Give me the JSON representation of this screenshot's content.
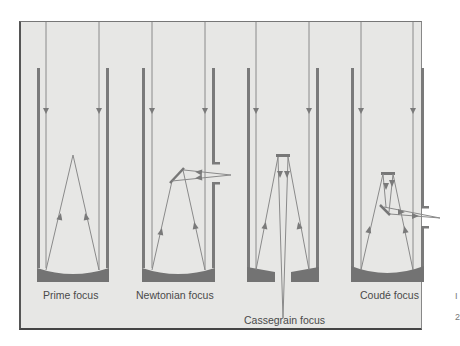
{
  "figure": {
    "panels": [
      {
        "id": "prime",
        "label": "Prime focus"
      },
      {
        "id": "newtonian",
        "label": "Newtonian focus"
      },
      {
        "id": "cassegrain",
        "label": "Cassegrain focus"
      },
      {
        "id": "coude",
        "label": "Coudé focus"
      }
    ],
    "colors": {
      "background": "#e7e7e5",
      "tube_wall": "#7a7a7a",
      "mirror": "#737373",
      "ray": "#858585",
      "text": "#4a4a4a"
    },
    "margin_marks": [
      "I",
      "2"
    ]
  }
}
